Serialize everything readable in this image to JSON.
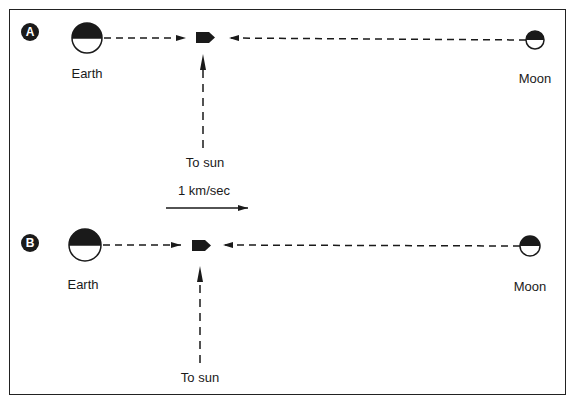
{
  "diagram": {
    "panels": [
      {
        "id": "A",
        "badge": "A",
        "earth_label": "Earth",
        "moon_label": "Moon",
        "sun_label": "To sun",
        "description": "Spacecraft between Earth and Moon; Earth's pull (left arrow) and Moon's pull (right arrow) point toward spacecraft, sun direction arrow from below"
      },
      {
        "id": "B",
        "badge": "B",
        "earth_label": "Earth",
        "moon_label": "Moon",
        "sun_label": "To sun",
        "description": "Same configuration shifted; spacecraft slightly closer to Earth"
      }
    ],
    "scale": {
      "label": "1 km/sec"
    },
    "colors": {
      "ink": "#1a1a1a",
      "background": "#ffffff"
    }
  }
}
